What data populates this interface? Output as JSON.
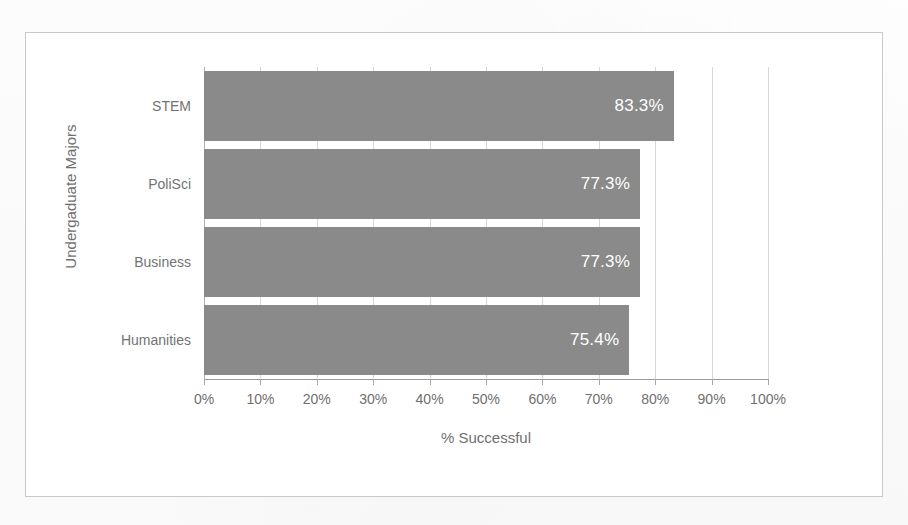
{
  "chart_data": {
    "type": "bar",
    "orientation": "horizontal",
    "title": "",
    "xlabel": "% Successful",
    "ylabel": "Undergaduate Majors",
    "categories": [
      "STEM",
      "PoliSci",
      "Business",
      "Humanities"
    ],
    "values": [
      83.3,
      77.3,
      77.3,
      75.4
    ],
    "data_labels": [
      "83.3%",
      "77.3%",
      "77.3%",
      "75.4%"
    ],
    "xlim": [
      0,
      100
    ],
    "xticks": [
      0,
      10,
      20,
      30,
      40,
      50,
      60,
      70,
      80,
      90,
      100
    ],
    "xtick_labels": [
      "0%",
      "10%",
      "20%",
      "30%",
      "40%",
      "50%",
      "60%",
      "70%",
      "80%",
      "90%",
      "100%"
    ],
    "grid": true,
    "grid_axis": "x",
    "legend": false,
    "series": [
      {
        "name": "% Successful",
        "values": [
          83.3,
          77.3,
          77.3,
          75.4
        ],
        "color": "#8a8a8a"
      }
    ]
  },
  "style": {
    "bar_color": "#8a8a8a",
    "data_label_color": "#ffffff",
    "tick_label_color": "#6f6f6f",
    "axis_title_color": "#6f6f6f",
    "gridline_color": "#d6d6d6",
    "frame_border_color": "#c9c9c9",
    "background": "#ffffff"
  }
}
